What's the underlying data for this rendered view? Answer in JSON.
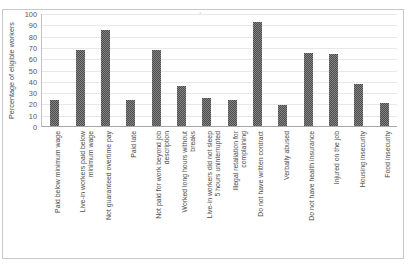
{
  "chart_data": {
    "type": "bar",
    "title": "",
    "xlabel": "",
    "ylabel": "Percentage of eligible workers",
    "ylim": [
      0,
      100
    ],
    "yticks": [
      100,
      90,
      80,
      70,
      60,
      50,
      40,
      30,
      20,
      10,
      0
    ],
    "grid": true,
    "legend": false,
    "bar_color": "#4d4d4d",
    "categories": [
      "Paid below minimum wage",
      "Live-in workers paid below\nminimum wage",
      "Not guaranteed overtime pay",
      "Paid late",
      "Not paid for work beyond job\ndescription",
      "Worked long hours without\nbreaks",
      "Live-in workers did not sleep\n5 hours uninterrupted",
      "Illegal retaliation for\ncomplaining",
      "Do not have written contract",
      "Verbally abused",
      "Do not have health insurance",
      "Injured on the job",
      "Housing insecurity",
      "Food insecurity"
    ],
    "values": [
      23,
      67,
      85,
      23,
      67,
      35,
      25,
      23,
      92,
      19,
      65,
      64,
      37,
      20
    ]
  }
}
